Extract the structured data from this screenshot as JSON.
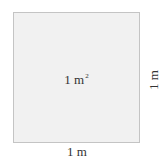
{
  "diagram": {
    "shape": "square",
    "fill_color": "#f1f1f1",
    "border_color": "#c4c4c4",
    "area_label": {
      "value": "1 m",
      "exponent": "2"
    },
    "side_label": "1 m",
    "bottom_label": "1 m"
  }
}
